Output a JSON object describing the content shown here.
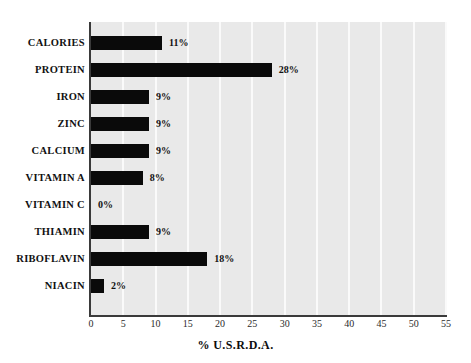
{
  "chart_data": {
    "type": "bar",
    "orientation": "horizontal",
    "title": "",
    "xlabel": "% U.S.R.D.A.",
    "ylabel": "",
    "xlim": [
      0,
      55
    ],
    "xticks": [
      0,
      5,
      10,
      15,
      20,
      25,
      30,
      35,
      40,
      45,
      50,
      55
    ],
    "xtick_labels": [
      "0",
      "5",
      "10",
      "15",
      "20",
      "25",
      "30",
      "35",
      "40",
      "45",
      "50",
      "55"
    ],
    "grid": "vertical",
    "legend": "none",
    "categories": [
      "CALORIES",
      "PROTEIN",
      "IRON",
      "ZINC",
      "CALCIUM",
      "VITAMIN A",
      "VITAMIN C",
      "THIAMIN",
      "RIBOFLAVIN",
      "NIACIN"
    ],
    "values": [
      11,
      28,
      9,
      9,
      9,
      8,
      0,
      9,
      18,
      2
    ],
    "data_labels": [
      "11%",
      "28%",
      "9%",
      "9%",
      "9%",
      "8%",
      "0%",
      "9%",
      "18%",
      "2%"
    ],
    "colors": {
      "bar": "#0a0a0a",
      "plot_background": "#e9e9e9",
      "gridline": "#fafafa",
      "axis": "#3a3a3a",
      "text": "#111111",
      "page_background": "#ffffff"
    }
  }
}
